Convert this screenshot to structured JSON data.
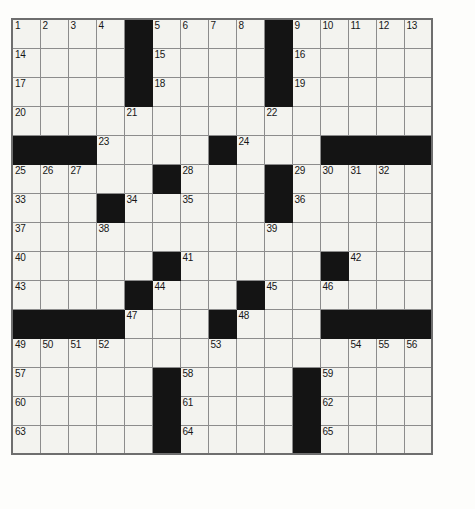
{
  "puzzle": {
    "kind": "crossword-grid",
    "rows": 15,
    "columns": 15,
    "cell_size_px": 30,
    "colors": {
      "block": "#141414",
      "cell": "#f3f3ef",
      "grid_line": "#8c8c8c",
      "border": "#6e6e6e",
      "number_text": "#161616",
      "page_background": "#fdfdfb"
    },
    "highest_number": 65,
    "grid": [
      [
        {
          "num": "1"
        },
        {
          "num": "2"
        },
        {
          "num": "3"
        },
        {
          "num": "4"
        },
        {
          "block": true
        },
        {
          "num": "5"
        },
        {
          "num": "6"
        },
        {
          "num": "7"
        },
        {
          "num": "8"
        },
        {
          "block": true
        },
        {
          "num": "9"
        },
        {
          "num": "10"
        },
        {
          "num": "11"
        },
        {
          "num": "12"
        },
        {
          "num": "13"
        }
      ],
      [
        {
          "num": "14"
        },
        {},
        {},
        {},
        {
          "block": true
        },
        {
          "num": "15"
        },
        {},
        {},
        {},
        {
          "block": true
        },
        {
          "num": "16"
        },
        {},
        {},
        {},
        {}
      ],
      [
        {
          "num": "17"
        },
        {},
        {},
        {},
        {
          "block": true
        },
        {
          "num": "18"
        },
        {},
        {},
        {},
        {
          "block": true
        },
        {
          "num": "19"
        },
        {},
        {},
        {},
        {}
      ],
      [
        {
          "num": "20"
        },
        {},
        {},
        {},
        {
          "num": "21"
        },
        {},
        {},
        {},
        {},
        {
          "num": "22"
        },
        {},
        {},
        {},
        {},
        {}
      ],
      [
        {
          "block": true
        },
        {
          "block": true
        },
        {
          "block": true
        },
        {
          "num": "23"
        },
        {},
        {},
        {},
        {
          "block": true
        },
        {
          "num": "24"
        },
        {},
        {},
        {
          "block": true
        },
        {
          "block": true
        },
        {
          "block": true
        },
        {
          "block": true
        }
      ],
      [
        {
          "num": "25"
        },
        {
          "num": "26"
        },
        {
          "num": "27"
        },
        {},
        {},
        {
          "block": true
        },
        {
          "num": "28"
        },
        {},
        {},
        {
          "block": true
        },
        {
          "num": "29"
        },
        {
          "num": "30"
        },
        {
          "num": "31"
        },
        {
          "num": "32"
        },
        {}
      ],
      [
        {
          "num": "33"
        },
        {},
        {},
        {
          "block": true
        },
        {
          "num": "34"
        },
        {},
        {
          "num": "35"
        },
        {},
        {},
        {
          "block": true
        },
        {
          "num": "36"
        },
        {},
        {},
        {},
        {}
      ],
      [
        {
          "num": "37"
        },
        {},
        {},
        {
          "num": "38"
        },
        {},
        {},
        {},
        {},
        {},
        {
          "num": "39"
        },
        {},
        {},
        {},
        {},
        {}
      ],
      [
        {
          "num": "40"
        },
        {},
        {},
        {},
        {},
        {
          "block": true
        },
        {
          "num": "41"
        },
        {},
        {},
        {},
        {},
        {
          "block": true
        },
        {
          "num": "42"
        },
        {},
        {}
      ],
      [
        {
          "num": "43"
        },
        {},
        {},
        {},
        {
          "block": true
        },
        {
          "num": "44"
        },
        {},
        {},
        {
          "block": true
        },
        {
          "num": "45"
        },
        {},
        {
          "num": "46"
        },
        {},
        {},
        {}
      ],
      [
        {
          "block": true
        },
        {
          "block": true
        },
        {
          "block": true
        },
        {
          "block": true
        },
        {
          "num": "47"
        },
        {},
        {},
        {
          "block": true
        },
        {
          "num": "48"
        },
        {},
        {},
        {
          "block": true
        },
        {
          "block": true
        },
        {
          "block": true
        },
        {
          "block": true
        }
      ],
      [
        {
          "num": "49"
        },
        {
          "num": "50"
        },
        {
          "num": "51"
        },
        {
          "num": "52"
        },
        {},
        {},
        {},
        {
          "num": "53"
        },
        {},
        {},
        {},
        {},
        {
          "num": "54"
        },
        {
          "num": "55"
        },
        {
          "num": "56"
        }
      ],
      [
        {
          "num": "57"
        },
        {},
        {},
        {},
        {},
        {
          "block": true
        },
        {
          "num": "58"
        },
        {},
        {},
        {},
        {
          "block": true
        },
        {
          "num": "59"
        },
        {},
        {},
        {}
      ],
      [
        {
          "num": "60"
        },
        {},
        {},
        {},
        {},
        {
          "block": true
        },
        {
          "num": "61"
        },
        {},
        {},
        {},
        {
          "block": true
        },
        {
          "num": "62"
        },
        {},
        {},
        {}
      ],
      [
        {
          "num": "63"
        },
        {},
        {},
        {},
        {},
        {
          "block": true
        },
        {
          "num": "64"
        },
        {},
        {},
        {},
        {
          "block": true
        },
        {
          "num": "65"
        },
        {},
        {},
        {}
      ]
    ]
  }
}
